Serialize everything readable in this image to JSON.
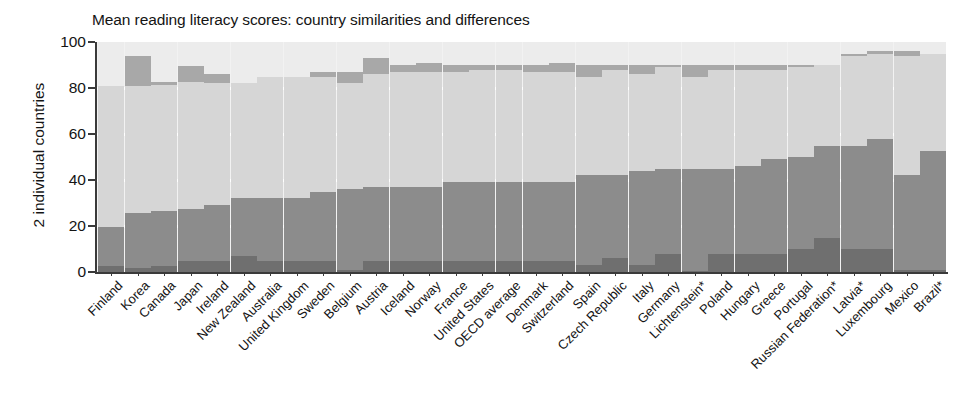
{
  "chart_data": {
    "type": "bar",
    "subtype": "stacked-percentage",
    "title": "Mean reading literacy scores: country similarities and differences",
    "xlabel": "",
    "ylabel": "2 individual countries",
    "ylim": [
      0,
      100
    ],
    "yticks": [
      0,
      20,
      40,
      60,
      80,
      100
    ],
    "grid": true,
    "legend": "none",
    "categories": [
      "Finland",
      "Korea",
      "Canada",
      "Japan",
      "Ireland",
      "New Zealand",
      "Australia",
      "United Kingdom",
      "Sweden",
      "Belgium",
      "Austria",
      "Iceland",
      "Norway",
      "France",
      "United States",
      "OECD average",
      "Denmark",
      "Switzerland",
      "Spain",
      "Czech Republic",
      "Italy",
      "Germany",
      "Lichtenstein*",
      "Poland",
      "Hungary",
      "Greece",
      "Portugal",
      "Russian Federation*",
      "Latvia*",
      "Luxembourg",
      "Mexico",
      "Brazil*"
    ],
    "series": [
      {
        "name": "Significantly lower - lowest band",
        "color": "#6f6f6f",
        "values": [
          2.5,
          1.8,
          2.5,
          5.0,
          5.0,
          7.0,
          5.0,
          5.0,
          5.0,
          1.0,
          5.0,
          5.0,
          5.0,
          5.0,
          5.0,
          5.0,
          5.0,
          5.0,
          3.0,
          6.0,
          3.0,
          8.0,
          0.5,
          8.0,
          8.0,
          8.0,
          10.0,
          15.0,
          10.0,
          10.0,
          1.0,
          0.8
        ]
      },
      {
        "name": "Not significantly different - lower",
        "color": "#8c8c8c",
        "values": [
          17.0,
          23.7,
          24.0,
          22.5,
          24.0,
          25.0,
          27.0,
          27.0,
          30.0,
          35.0,
          32.0,
          32.0,
          32.0,
          34.0,
          34.0,
          34.0,
          34.0,
          34.0,
          39.0,
          36.0,
          41.0,
          37.0,
          44.5,
          37.0,
          38.0,
          41.0,
          40.0,
          40.0,
          45.0,
          48.0,
          41.0,
          52.0
        ]
      },
      {
        "name": "Middle band",
        "color": "#d6d6d6",
        "values": [
          61.5,
          55.5,
          55.0,
          55.0,
          53.0,
          50.0,
          53.0,
          53.0,
          50.0,
          46.0,
          49.0,
          50.0,
          50.0,
          48.0,
          49.0,
          49.0,
          48.0,
          48.0,
          43.0,
          46.0,
          42.0,
          44.0,
          40.0,
          43.0,
          42.0,
          39.0,
          39.0,
          35.0,
          39.0,
          37.0,
          52.0,
          42.0
        ]
      },
      {
        "name": "Upper band",
        "color": "#a8a8a8",
        "values": [
          0.0,
          13.0,
          1.0,
          7.0,
          4.0,
          0.0,
          0.0,
          0.0,
          2.0,
          5.0,
          7.0,
          3.0,
          4.0,
          3.0,
          2.0,
          2.0,
          3.0,
          4.0,
          5.0,
          2.0,
          4.0,
          1.0,
          5.0,
          2.0,
          2.0,
          2.0,
          1.0,
          0.0,
          1.0,
          1.0,
          2.0,
          0.0
        ]
      },
      {
        "name": "Highest band",
        "color": "#ececec",
        "values": [
          19.0,
          6.0,
          17.5,
          10.5,
          14.0,
          18.0,
          15.0,
          15.0,
          13.0,
          13.0,
          7.0,
          10.0,
          9.0,
          10.0,
          10.0,
          10.0,
          10.0,
          9.0,
          10.0,
          10.0,
          10.0,
          10.0,
          10.0,
          10.0,
          10.0,
          10.0,
          10.0,
          10.0,
          5.0,
          4.0,
          4.0,
          5.2
        ]
      }
    ],
    "bar_tops": [
      100,
      94,
      100,
      90,
      100,
      100,
      100,
      100,
      100,
      100,
      93,
      100,
      100,
      100,
      100,
      100,
      100,
      100,
      100,
      100,
      100,
      100,
      100,
      100,
      100,
      100,
      100,
      100,
      100,
      100,
      100,
      100
    ]
  }
}
